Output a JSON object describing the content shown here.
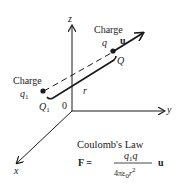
{
  "axes": {
    "z_label": "z",
    "y_label": "y",
    "x_label": "x",
    "origin_label": "0"
  },
  "charge_q": {
    "title": "Charge",
    "symbol": "q",
    "point_label": "Q",
    "vector_label": "u"
  },
  "charge_q1": {
    "title": "Charge",
    "symbol": "q",
    "subscript": "1",
    "point_label": "Q",
    "point_subscript": "1"
  },
  "distance_label": "r",
  "law": {
    "title": "Coulomb's Law",
    "lhs": "F =",
    "numerator": "q",
    "numerator_sub": "1",
    "numerator_tail": "q",
    "denominator": "4πε",
    "denominator_sub": "0",
    "denominator_tail": "r",
    "denominator_sup": "2",
    "unit_vector": "u"
  },
  "colors": {
    "ink": "#1a1a1a",
    "background": "#ffffff"
  }
}
